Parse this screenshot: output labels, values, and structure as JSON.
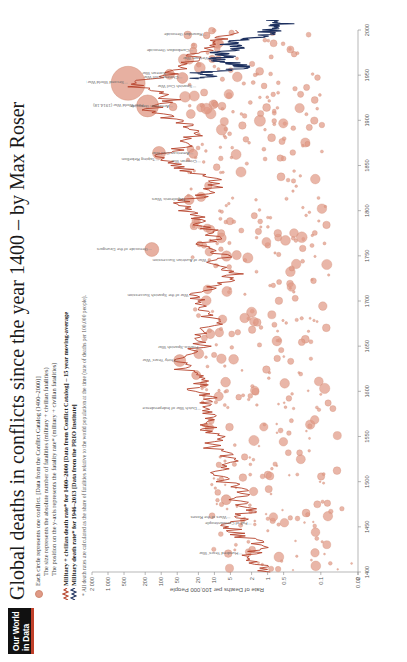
{
  "brand": {
    "line1": "Our World",
    "line2": "in Data"
  },
  "header": {
    "title": "Global deaths in conflicts since the year 1400 – by Max Roser"
  },
  "legend": {
    "circle_entry": "Each circle represents one conflict. [Data from the Conflict Catalog (1400–2000)]",
    "circle_sub_1_kw": "size",
    "circle_sub_1": "The size represents the absolute number of fatalities (military + civilian fatalities)",
    "circle_sub_2_kw": "position",
    "circle_sub_2": "The position on the y-axis represents the fatality rate* (military + civilian fatalities)",
    "line_red": "Military + civilian death rate* for 1400–2000 [Data from Conflict Catalog] – 15 year moving-average",
    "line_navy": "Military death rate* for 1946–2013 [Data from the PRIO Institute]",
    "footnote": "* All death rates are calculated as the share of fatalities relative to the world population at the time (rate of deaths per 100,000 people)."
  },
  "colors": {
    "circle_fill": "#e09a86",
    "circle_stroke": "#cf8870",
    "line_red": "#b5422a",
    "line_navy": "#1c2f5e",
    "accent": "#c0402a",
    "axis": "#888888",
    "text": "#555555"
  },
  "chart_data": {
    "type": "scatter",
    "title": "Global deaths in conflicts since the year 1400",
    "xlabel": "",
    "ylabel": "Rate of Deaths per 100,000 People",
    "xlim": [
      1400,
      2000
    ],
    "ylim_log": [
      0.02,
      2000
    ],
    "grid": false,
    "legend_position": "top",
    "x_ticks": [
      1400,
      1450,
      1500,
      1550,
      1600,
      1650,
      1700,
      1750,
      1800,
      1850,
      1900,
      1950,
      2000
    ],
    "y_ticks": [
      "2 000",
      "1 000",
      "500",
      "200",
      "100",
      "50",
      "20",
      "10",
      "5",
      "2",
      "1",
      "0.5",
      "0.1",
      "0.02",
      "0"
    ],
    "y_tick_values": [
      2000,
      1000,
      500,
      200,
      100,
      50,
      20,
      10,
      5,
      2,
      1,
      0.5,
      0.1,
      0.02,
      0
    ],
    "series": [
      {
        "name": "Military + civilian death rate* for 1400–2000 (15 year moving-average)",
        "type": "line",
        "color": "#b5422a",
        "source": "Conflict Catalog",
        "x": [
          1400,
          1410,
          1420,
          1430,
          1440,
          1450,
          1460,
          1470,
          1480,
          1490,
          1500,
          1510,
          1520,
          1530,
          1540,
          1550,
          1560,
          1570,
          1580,
          1590,
          1600,
          1610,
          1620,
          1630,
          1640,
          1650,
          1660,
          1670,
          1680,
          1690,
          1700,
          1710,
          1720,
          1730,
          1740,
          1750,
          1760,
          1770,
          1780,
          1790,
          1800,
          1810,
          1820,
          1830,
          1840,
          1850,
          1860,
          1870,
          1880,
          1890,
          1900,
          1910,
          1920,
          1930,
          1940,
          1950,
          1960,
          1970,
          1980,
          1990,
          2000
        ],
        "y": [
          0.9,
          1.4,
          2.2,
          1.1,
          3.0,
          5.0,
          3.5,
          2.0,
          4.0,
          2.5,
          6.0,
          9.0,
          5.0,
          7.0,
          12.0,
          8.0,
          14.0,
          10.0,
          18.0,
          11.0,
          22.0,
          16.0,
          30.0,
          45.0,
          28.0,
          17.0,
          24.0,
          12.0,
          9.0,
          20.0,
          16.0,
          26.0,
          6.0,
          4.0,
          12.0,
          7.0,
          18.0,
          9.0,
          14.0,
          22.0,
          30.0,
          40.0,
          12.0,
          8.0,
          20.0,
          60.0,
          110.0,
          40.0,
          25.0,
          30.0,
          45.0,
          180.0,
          60.0,
          90.0,
          420.0,
          70.0,
          40.0,
          25.0,
          14.0,
          8.0,
          4.0
        ]
      },
      {
        "name": "Military death rate* for 1946–2013 (PRIO)",
        "type": "line",
        "color": "#1c2f5e",
        "source": "PRIO Institute",
        "x": [
          1946,
          1950,
          1953,
          1956,
          1960,
          1965,
          1968,
          1971,
          1975,
          1980,
          1984,
          1988,
          1991,
          1995,
          1999,
          2003,
          2007,
          2011,
          2013
        ],
        "y": [
          20.0,
          9.0,
          22.0,
          4.0,
          2.5,
          6.0,
          11.0,
          5.0,
          9.0,
          3.0,
          5.0,
          4.0,
          2.0,
          1.2,
          0.9,
          0.8,
          0.5,
          0.7,
          0.9
        ]
      },
      {
        "name": "Individual conflicts (circle size = absolute fatalities)",
        "type": "scatter",
        "color": "#e09a86",
        "source": "Conflict Catalog (1400–2000)"
      }
    ],
    "annotations": [
      {
        "label": "Second World War (1939-45)",
        "x": 1941,
        "y": 420
      },
      {
        "label": "First World War (1914-18)",
        "x": 1916,
        "y": 180
      },
      {
        "label": "Genocide of the Dzungars",
        "x": 1757,
        "y": 150
      },
      {
        "label": "Thirty Years' War",
        "x": 1634,
        "y": 45
      },
      {
        "label": "Taiping Rebellion",
        "x": 1856,
        "y": 110
      },
      {
        "label": "American Civil War",
        "x": 1863,
        "y": 25
      },
      {
        "label": "Crimean War",
        "x": 1854,
        "y": 18
      },
      {
        "label": "Napoleonic Wars",
        "x": 1812,
        "y": 30
      },
      {
        "label": "War of the Spanish Succession",
        "x": 1706,
        "y": 26
      },
      {
        "label": "War of Austrian Succession",
        "x": 1744,
        "y": 12
      },
      {
        "label": "Dutch War of Independence",
        "x": 1580,
        "y": 18
      },
      {
        "label": "Franco-Spanish War",
        "x": 1648,
        "y": 17
      },
      {
        "label": "Korean War",
        "x": 1951,
        "y": 70
      },
      {
        "label": "Vietnam War",
        "x": 1968,
        "y": 11
      },
      {
        "label": "Chinese Civil War",
        "x": 1947,
        "y": 40
      },
      {
        "label": "Rwandan Genocide",
        "x": 1994,
        "y": 14
      },
      {
        "label": "Cambodian Genocide",
        "x": 1977,
        "y": 25
      },
      {
        "label": "Armenian Genocide",
        "x": 1915,
        "y": 60
      },
      {
        "label": "Spanish Civil War",
        "x": 1937,
        "y": 22
      },
      {
        "label": "Wars of the Roses",
        "x": 1460,
        "y": 5
      },
      {
        "label": "Hundred Years' War",
        "x": 1420,
        "y": 3
      },
      {
        "label": "Fall of Constantinople",
        "x": 1453,
        "y": 2
      }
    ]
  }
}
